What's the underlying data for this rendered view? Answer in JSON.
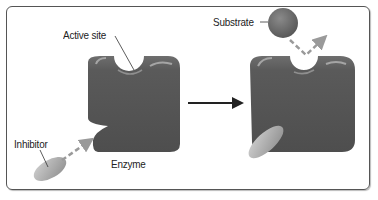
{
  "diagram": {
    "labels": {
      "active_site": "Active site",
      "substrate": "Substrate",
      "inhibitor": "Inhibitor",
      "enzyme": "Enzyme"
    },
    "colors": {
      "enzyme": "#555555",
      "enzyme_highlight": "#9a9a9a",
      "substrate": "#6a6a6a",
      "inhibitor": "#a8a8a8",
      "arrow_dashed": "#9a9a9a",
      "arrow_solid": "#222222",
      "frame": "#555555"
    },
    "panels": [
      {
        "state": "before",
        "description": "Enzyme with open active site; inhibitor approaching allosteric site"
      },
      {
        "state": "after",
        "description": "Inhibitor bound to enzyme; active site altered; substrate deflected"
      }
    ]
  }
}
